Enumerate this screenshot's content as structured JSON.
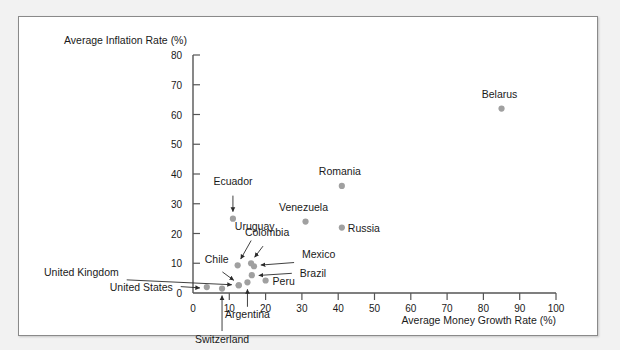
{
  "chart_data": {
    "type": "scatter",
    "title": "",
    "xlabel": "Average Money Growth Rate (%)",
    "ylabel": "Average Inflation Rate (%)",
    "xlim": [
      0,
      100
    ],
    "ylim": [
      0,
      80
    ],
    "xticks": [
      0,
      10,
      20,
      30,
      40,
      50,
      60,
      70,
      80,
      90,
      100
    ],
    "yticks": [
      0,
      10,
      20,
      30,
      40,
      50,
      60,
      70,
      80
    ],
    "grid": false,
    "legend": "none",
    "point_color": "#a0a0a0",
    "points": [
      {
        "name": "Belarus",
        "x": 85.0,
        "y": 62.0,
        "label_dx": -2,
        "label_dy": -11,
        "label_anchor": "middle",
        "leader": false
      },
      {
        "name": "Romania",
        "x": 41.0,
        "y": 36.0,
        "label_dx": -2,
        "label_dy": -11,
        "label_anchor": "middle",
        "leader": false
      },
      {
        "name": "Venezuela",
        "x": 31.0,
        "y": 24.0,
        "label_dx": -2,
        "label_dy": -11,
        "label_anchor": "middle",
        "leader": false
      },
      {
        "name": "Russia",
        "x": 41.0,
        "y": 22.0,
        "label_dx": 6,
        "label_dy": 4,
        "label_anchor": "start",
        "leader": false
      },
      {
        "name": "Ecuador",
        "x": 11.0,
        "y": 25.0,
        "label_dx": 0,
        "label_dy": -34,
        "label_anchor": "middle",
        "leader": true
      },
      {
        "name": "Uruguay",
        "x": 12.3,
        "y": 9.3,
        "label_dx": 17,
        "label_dy": -35,
        "label_anchor": "middle",
        "leader": true
      },
      {
        "name": "Colombia",
        "x": 16.0,
        "y": 10.0,
        "label_dx": 16,
        "label_dy": -27,
        "label_anchor": "middle",
        "leader": true
      },
      {
        "name": "Mexico",
        "x": 16.8,
        "y": 9.0,
        "label_dx": 48,
        "label_dy": -8,
        "label_anchor": "start",
        "leader": true
      },
      {
        "name": "Brazil",
        "x": 16.2,
        "y": 6.0,
        "label_dx": 48,
        "label_dy": 2,
        "label_anchor": "start",
        "leader": true
      },
      {
        "name": "Peru",
        "x": 20.0,
        "y": 4.2,
        "label_dx": 7,
        "label_dy": 4,
        "label_anchor": "start",
        "leader": false
      },
      {
        "name": "Chile",
        "x": 12.6,
        "y": 2.6,
        "label_dx": -22,
        "label_dy": -22,
        "label_anchor": "middle",
        "leader": true
      },
      {
        "name": "United Kingdom",
        "x": 12.6,
        "y": 2.6,
        "label_dx": -120,
        "label_dy": -9,
        "label_anchor": "end",
        "leader": true
      },
      {
        "name": "United States",
        "x": 3.8,
        "y": 2.0,
        "label_dx": -34,
        "label_dy": 4,
        "label_anchor": "end",
        "leader": true
      },
      {
        "name": "Argentina",
        "x": 15.0,
        "y": 3.6,
        "label_dx": 0,
        "label_dy": 36,
        "label_anchor": "middle",
        "leader": true
      },
      {
        "name": "Switzerland",
        "x": 8.0,
        "y": 1.5,
        "label_dx": 0,
        "label_dy": 54,
        "label_anchor": "middle",
        "leader": true
      }
    ]
  }
}
